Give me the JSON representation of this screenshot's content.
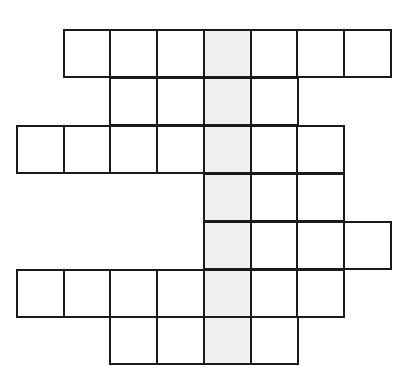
{
  "puzzle": {
    "type": "crossword-grid",
    "cell_size": 47,
    "origin": {
      "x": 17,
      "y": 30
    },
    "highlight_column": 4,
    "colors": {
      "line": "#1a1a1a",
      "cell": "#ffffff",
      "highlight": "#f0f0f0"
    },
    "rows": [
      {
        "row": 0,
        "start_col": 1,
        "end_col": 7
      },
      {
        "row": 1,
        "start_col": 2,
        "end_col": 5
      },
      {
        "row": 2,
        "start_col": 0,
        "end_col": 6
      },
      {
        "row": 3,
        "start_col": 4,
        "end_col": 6
      },
      {
        "row": 4,
        "start_col": 4,
        "end_col": 7
      },
      {
        "row": 5,
        "start_col": 0,
        "end_col": 6
      },
      {
        "row": 6,
        "start_col": 2,
        "end_col": 5
      }
    ]
  }
}
